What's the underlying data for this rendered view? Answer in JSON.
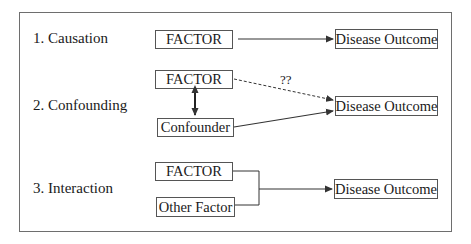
{
  "diagram": {
    "sections": [
      {
        "label": "1.  Causation",
        "factor": "FACTOR",
        "outcome": "Disease Outcome"
      },
      {
        "label": "2.  Confounding",
        "factor": "FACTOR",
        "confounder": "Confounder",
        "outcome": "Disease Outcome",
        "uncertain_link": "??"
      },
      {
        "label": "3.  Interaction",
        "factor": "FACTOR",
        "other_factor": "Other Factor",
        "outcome": "Disease Outcome"
      }
    ],
    "colors": {
      "line": "#333333",
      "border": "#555555",
      "frame": "#6e6e6e"
    }
  }
}
